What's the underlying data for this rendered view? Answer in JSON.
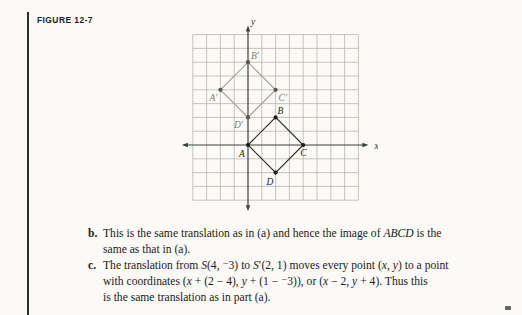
{
  "page": {
    "background": "#fbfaf7"
  },
  "figure_label": "FIGURE 12-7",
  "figure": {
    "unit": 13.8,
    "origin": {
      "x": 80,
      "y": 139
    },
    "x_range": [
      -4,
      8
    ],
    "y_range": [
      -4,
      8
    ],
    "grid_color": "#b4b2a9",
    "axis_color": "#3e3e3a",
    "axis_labels": {
      "x": "x",
      "y": "y"
    },
    "quads": [
      {
        "name": "image-quad-primed",
        "stroke": "#9d9d96",
        "dot_color": "#585852",
        "label_color": "#7d7c75",
        "vertices": [
          {
            "label": "A′",
            "x": -2,
            "y": 4,
            "dx": -11,
            "dy": 11
          },
          {
            "label": "B′",
            "x": 0,
            "y": 6,
            "dx": 3,
            "dy": -3
          },
          {
            "label": "C′",
            "x": 2,
            "y": 4,
            "dx": 3,
            "dy": 11
          },
          {
            "label": "D′",
            "x": 0,
            "y": 2,
            "dx": -14,
            "dy": 11
          }
        ]
      },
      {
        "name": "original-quad-abcd",
        "stroke": "#2d2d2a",
        "dot_color": "#1e1e1c",
        "label_color": "#1e1e1c",
        "vertices": [
          {
            "label": "A",
            "x": 0,
            "y": 0,
            "dx": -9,
            "dy": 12
          },
          {
            "label": "B",
            "x": 2,
            "y": 2,
            "dx": 2,
            "dy": -3
          },
          {
            "label": "C",
            "x": 4,
            "y": 0,
            "dx": -3,
            "dy": 11
          },
          {
            "label": "D",
            "x": 2,
            "y": -2,
            "dx": -9,
            "dy": 12
          }
        ]
      }
    ]
  },
  "solution": {
    "items": [
      {
        "label": "b.",
        "lines": [
          {
            "segs": [
              {
                "t": "This is the same translation as in (a) and hence the image of "
              },
              {
                "t": "ABCD"
              },
              {
                "t": " is the"
              }
            ]
          },
          {
            "segs": [
              {
                "t": "same as that in (a)."
              }
            ]
          }
        ]
      },
      {
        "label": "c.",
        "lines": [
          {
            "segs": [
              {
                "t": "The translation from "
              },
              {
                "t": "S"
              },
              {
                "t": "(4, ⁻3) to "
              },
              {
                "t": "S"
              },
              {
                "t": "′(2, 1) moves every point ("
              },
              {
                "t": "x"
              },
              {
                "t": ", "
              },
              {
                "t": "y"
              },
              {
                "t": ") to a point"
              }
            ]
          },
          {
            "segs": [
              {
                "t": "with coordinates ("
              },
              {
                "t": "x"
              },
              {
                "t": " + (2 − 4), "
              },
              {
                "t": "y"
              },
              {
                "t": " + (1 − ⁻3)), or ("
              },
              {
                "t": "x"
              },
              {
                "t": " − 2, "
              },
              {
                "t": "y"
              },
              {
                "t": " + 4). Thus this"
              }
            ]
          },
          {
            "segs": [
              {
                "t": "is the same translation as in part (a)."
              }
            ]
          }
        ]
      }
    ]
  }
}
